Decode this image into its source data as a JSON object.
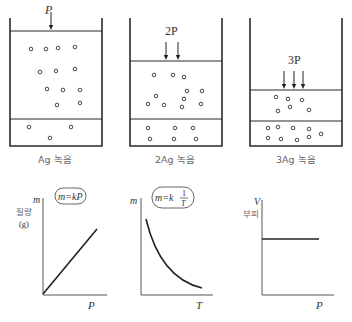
{
  "containers": [
    {
      "id": "ag",
      "caption": "Ag 녹음",
      "pressure_label": "P",
      "arrow_count": 1,
      "gas_particles": [
        [
          31,
          49
        ],
        [
          46,
          49
        ],
        [
          58,
          48
        ],
        [
          75,
          47
        ],
        [
          40,
          72
        ],
        [
          56,
          71
        ],
        [
          75,
          69
        ],
        [
          47,
          89
        ],
        [
          63,
          90
        ],
        [
          80,
          90
        ],
        [
          57,
          105
        ],
        [
          80,
          103
        ]
      ],
      "solution_particles": [
        [
          29,
          127
        ],
        [
          71,
          127
        ],
        [
          50,
          138
        ]
      ]
    },
    {
      "id": "2ag",
      "caption": "2Ag 녹음",
      "pressure_label": "2P",
      "arrow_count": 2,
      "gas_particles": [
        [
          154,
          75
        ],
        [
          173,
          75
        ],
        [
          184,
          77
        ],
        [
          187,
          91
        ],
        [
          202,
          91
        ],
        [
          156,
          96
        ],
        [
          184,
          99
        ],
        [
          148,
          104
        ],
        [
          164,
          105
        ],
        [
          182,
          107
        ],
        [
          201,
          104
        ]
      ],
      "solution_particles": [
        [
          148,
          128
        ],
        [
          175,
          128
        ],
        [
          193,
          128
        ],
        [
          150,
          139
        ],
        [
          174,
          139
        ],
        [
          196,
          139
        ]
      ]
    },
    {
      "id": "3ag",
      "caption": "3Ag 녹음",
      "pressure_label": "3P",
      "arrow_count": 3,
      "gas_particles": [
        [
          276,
          97
        ],
        [
          288,
          99
        ],
        [
          302,
          100
        ],
        [
          278,
          111
        ],
        [
          290,
          107
        ],
        [
          309,
          110
        ]
      ],
      "solution_particles": [
        [
          268,
          128
        ],
        [
          278,
          127
        ],
        [
          293,
          128
        ],
        [
          309,
          129
        ],
        [
          268,
          138
        ],
        [
          281,
          139
        ],
        [
          297,
          140
        ],
        [
          309,
          137
        ],
        [
          321,
          134
        ]
      ]
    }
  ],
  "graphs": [
    {
      "id": "mass-vs-pressure",
      "y_label": "m",
      "y_label_kor": "질량",
      "y_unit": "(g)",
      "x_label": "P",
      "formula": "m=kP",
      "type": "line"
    },
    {
      "id": "mass-vs-temperature",
      "y_label": "m",
      "x_label": "T",
      "formula_prefix": "m=k",
      "formula_num": "1",
      "formula_den": "T",
      "type": "curve"
    },
    {
      "id": "volume-vs-pressure",
      "y_label": "V",
      "y_label_kor": "부피",
      "x_label": "P",
      "type": "flat"
    }
  ],
  "chart_data": [
    {
      "type": "line",
      "title": "m=kP",
      "xlabel": "P",
      "ylabel": "m 질량 (g)",
      "x": [
        0,
        1
      ],
      "values": [
        0,
        1
      ],
      "note": "mass of dissolved gas proportional to pressure"
    },
    {
      "type": "line",
      "title": "m=k 1/T",
      "xlabel": "T",
      "ylabel": "m",
      "note": "mass of dissolved gas inversely proportional to temperature (decreasing curve)"
    },
    {
      "type": "line",
      "title": "",
      "xlabel": "P",
      "ylabel": "V 부피",
      "note": "dissolved gas volume constant with pressure (horizontal line)"
    }
  ],
  "colors": {
    "stroke": "#2a2a2a",
    "text": "#333333",
    "caption": "#666666"
  }
}
